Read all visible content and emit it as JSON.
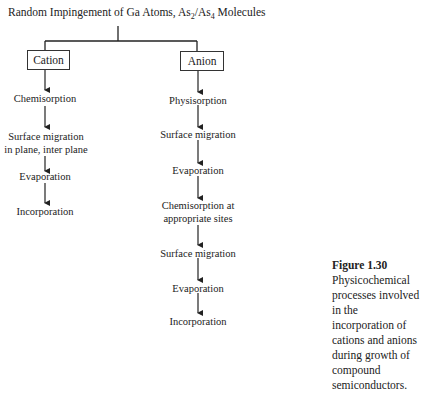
{
  "title": {
    "prefix": "Random Impingement of Ga Atoms, As",
    "sub1": "2",
    "mid": "/As",
    "sub2": "4",
    "suffix": " Molecules"
  },
  "branches": {
    "cation": {
      "label": "Cation",
      "steps": [
        "Chemisorption",
        "Surface migration",
        "in plane, inter plane",
        "Evaporation",
        "Incorporation"
      ]
    },
    "anion": {
      "label": "Anion",
      "steps": [
        "Physisorption",
        "Surface migration",
        "Evaporation",
        "Chemisorption at",
        "appropriate sites",
        "Surface migration",
        "Evaporation",
        "Incorporation"
      ]
    }
  },
  "caption": {
    "figure_label": "Figure 1.30",
    "text": "Physicochemical processes involved in the incorporation of cations and anions during growth of compound semiconductors."
  }
}
